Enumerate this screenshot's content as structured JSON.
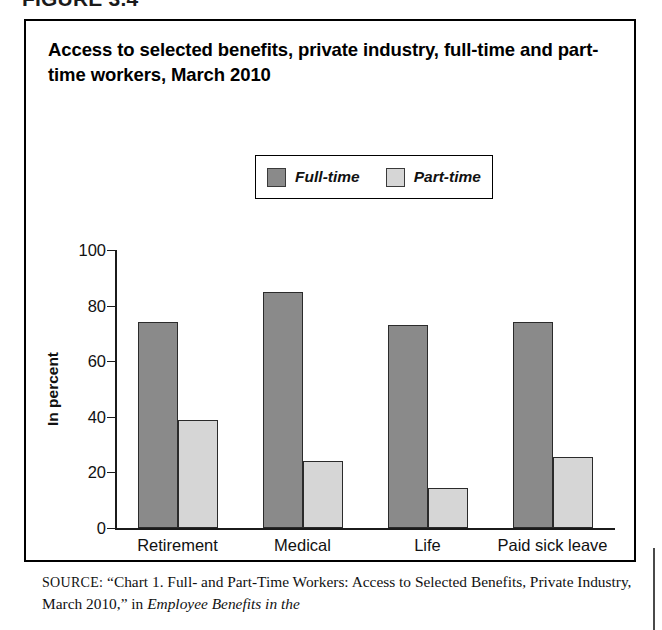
{
  "figure_header": "FIGURE 3.4",
  "chart_title": "Access to selected benefits, private industry, full-time and part-time workers, March 2010",
  "legend": {
    "items": [
      {
        "label": "Full-time",
        "color": "#8a8a8a",
        "swatch_name": "legend-swatch-full-time"
      },
      {
        "label": "Part-time",
        "color": "#d6d6d6",
        "swatch_name": "legend-swatch-part-time"
      }
    ]
  },
  "source": {
    "kicker": "SOURCE:",
    "text_before_italic": " “Chart 1. Full- and Part-Time Workers: Access to Selected Benefits, Private Industry, March 2010,” in ",
    "italic_title": "Employee Benefits in the"
  },
  "chart_data": {
    "type": "bar",
    "title": "Access to selected benefits, private industry, full-time and part-time workers, March 2010",
    "xlabel": "",
    "ylabel": "In percent",
    "ylim": [
      0,
      100
    ],
    "yticks": [
      0,
      20,
      40,
      60,
      80,
      100
    ],
    "grid": false,
    "legend_position": "top-center",
    "categories": [
      "Retirement",
      "Medical",
      "Life",
      "Paid sick leave"
    ],
    "series": [
      {
        "name": "Full-time",
        "color": "#8a8a8a",
        "values": [
          74,
          85,
          73,
          74
        ]
      },
      {
        "name": "Part-time",
        "color": "#d6d6d6",
        "values": [
          39,
          24,
          14.5,
          25.5
        ]
      }
    ]
  }
}
